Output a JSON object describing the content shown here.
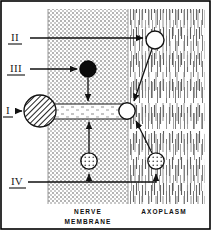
{
  "figure": {
    "border_color": "#000000",
    "background": "#ffffff"
  },
  "regions": [
    {
      "name": "nerve-membrane",
      "label": "NERVE",
      "label2": "MEMBRANE",
      "fill_style": "stipple",
      "color": "#9a9a9a"
    },
    {
      "name": "axoplasm",
      "label": "AXOPLASM",
      "fill_style": "vertical-dashes",
      "color": "#6d6d6d"
    }
  ],
  "labels": [
    {
      "id": "I",
      "text": "I",
      "target": "hatched-circle"
    },
    {
      "id": "II",
      "text": "II",
      "target": "open-circle-top"
    },
    {
      "id": "III",
      "text": "III",
      "target": "black-circle"
    },
    {
      "id": "IV",
      "text": "IV",
      "target": "stippled-circle-right"
    }
  ],
  "elements": [
    {
      "name": "hatched-circle",
      "style": "diagonal-hatch",
      "cx": 40,
      "cy": 111,
      "r": 16
    },
    {
      "name": "channel",
      "style": "speckled-band",
      "x": 52,
      "y": 104,
      "w": 76,
      "h": 14
    },
    {
      "name": "black-circle",
      "style": "solid-black",
      "cx": 88,
      "cy": 69,
      "r": 8
    },
    {
      "name": "open-circle-top",
      "style": "open-white",
      "cx": 155,
      "cy": 40,
      "r": 9
    },
    {
      "name": "open-circle-channel",
      "style": "open-white",
      "cx": 127,
      "cy": 111,
      "r": 8
    },
    {
      "name": "stippled-circle-left",
      "style": "stippled-white",
      "cx": 89,
      "cy": 161,
      "r": 8
    },
    {
      "name": "stippled-circle-right",
      "style": "stippled-white",
      "cx": 156,
      "cy": 161,
      "r": 8
    }
  ],
  "arrows": [
    {
      "name": "arrow-II-to-open-circle",
      "from": "label-II",
      "to": "open-circle-top"
    },
    {
      "name": "arrow-III-to-black-circle",
      "from": "label-III",
      "to": "black-circle"
    },
    {
      "name": "arrow-I-to-hatched-circle",
      "from": "label-I",
      "to": "hatched-circle"
    },
    {
      "name": "arrow-IV-to-stippled-right",
      "from": "label-IV",
      "to": "stippled-circle-right"
    },
    {
      "name": "arrow-black-circle-down",
      "from": "black-circle",
      "to": "channel"
    },
    {
      "name": "arrow-stippled-left-up",
      "from": "stippled-circle-left",
      "to": "channel"
    },
    {
      "name": "arrow-open-top-to-channel",
      "from": "open-circle-top",
      "to": "open-circle-channel"
    },
    {
      "name": "arrow-stippled-right-to-channel",
      "from": "stippled-circle-right",
      "to": "open-circle-channel"
    },
    {
      "name": "arrow-iv-line-to-stippled-left",
      "from": "label-IV",
      "to": "stippled-circle-left"
    }
  ]
}
